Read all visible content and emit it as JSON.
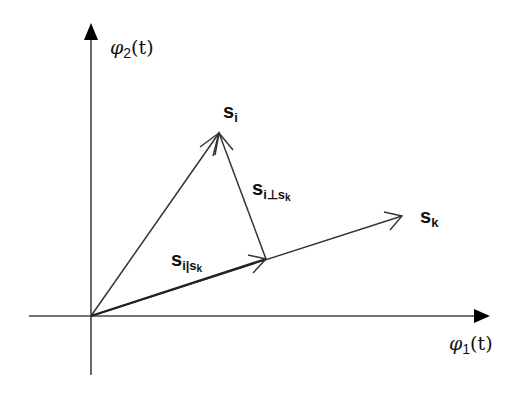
{
  "diagram": {
    "type": "vector-projection",
    "axes": {
      "x": {
        "label_base": "φ",
        "label_sub": "1",
        "label_arg": "(t)"
      },
      "y": {
        "label_base": "φ",
        "label_sub": "2",
        "label_arg": "(t)"
      }
    },
    "vectors": [
      {
        "id": "s_i",
        "base": "s",
        "sub": "i",
        "from": [
          91,
          316
        ],
        "to": [
          219,
          133
        ]
      },
      {
        "id": "s_k",
        "base": "s",
        "sub": "k",
        "from": [
          91,
          316
        ],
        "to": [
          402,
          216
        ]
      },
      {
        "id": "s_i_parallel_s_k",
        "base": "s",
        "sub": "i|s",
        "subsub": "k",
        "from": [
          91,
          316
        ],
        "to": [
          266,
          259
        ]
      },
      {
        "id": "s_i_perp_s_k",
        "base": "s",
        "sub": "i⊥s",
        "subsub": "k",
        "from": [
          266,
          259
        ],
        "to": [
          219,
          133
        ]
      }
    ],
    "colors": {
      "stroke": "#333333",
      "text": "#111111",
      "background": "#ffffff"
    }
  }
}
